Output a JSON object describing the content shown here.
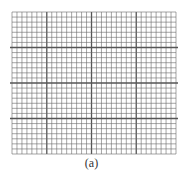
{
  "figure": {
    "caption": "(a)",
    "line_color": "#6a6a6a",
    "major_line_color": "#555555",
    "background": "#ffffff",
    "minor_columns": 33,
    "minor_rows": 28,
    "major_vertical_every": [
      7,
      16,
      25
    ],
    "major_horizontal_every": [
      7,
      14,
      21
    ]
  }
}
